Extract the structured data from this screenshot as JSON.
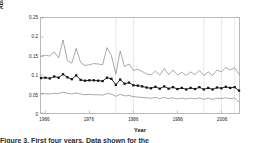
{
  "chart_data": {
    "type": "line",
    "title": "",
    "xlabel": "Year",
    "ylabel": "Abundance index",
    "xlim": [
      1965,
      2010
    ],
    "ylim": [
      0,
      0.25
    ],
    "xticks": [
      1966,
      1976,
      1986,
      1996,
      2006
    ],
    "yticks": [
      0,
      0.05,
      0.1,
      0.15,
      0.2,
      0.25
    ],
    "ytick_labels": [
      "0",
      "0.05",
      "0.1",
      "0.15",
      "0.2",
      "0.25"
    ],
    "xtick_labels": [
      "1966",
      "1976",
      "1986",
      "1996",
      "2006"
    ],
    "grid": "vertical-faint",
    "legend": "none",
    "gridlines_x": [
      1982,
      1986,
      2002,
      2006,
      2009
    ],
    "x": [
      1965,
      1966,
      1967,
      1968,
      1969,
      1970,
      1971,
      1972,
      1973,
      1974,
      1975,
      1976,
      1977,
      1978,
      1979,
      1980,
      1981,
      1982,
      1983,
      1984,
      1985,
      1986,
      1987,
      1988,
      1989,
      1990,
      1991,
      1992,
      1993,
      1994,
      1995,
      1996,
      1997,
      1998,
      1999,
      2000,
      2001,
      2002,
      2003,
      2004,
      2005,
      2006,
      2007,
      2008,
      2009,
      2010
    ],
    "series": [
      {
        "name": "Upper confidence limit",
        "style": "thin-line",
        "marker": "none",
        "color": "#6f6f6f",
        "values": [
          0.149,
          0.152,
          0.15,
          0.161,
          0.145,
          0.192,
          0.138,
          0.131,
          0.17,
          0.133,
          0.125,
          0.127,
          0.13,
          0.129,
          0.127,
          0.172,
          0.151,
          0.103,
          0.163,
          0.122,
          0.129,
          0.112,
          0.115,
          0.109,
          0.103,
          0.1,
          0.11,
          0.1,
          0.117,
          0.101,
          0.113,
          0.1,
          0.107,
          0.099,
          0.108,
          0.101,
          0.112,
          0.099,
          0.108,
          0.099,
          0.113,
          0.108,
          0.12,
          0.113,
          0.119,
          0.102
        ]
      },
      {
        "name": "Abundance index (central estimate)",
        "style": "line-with-markers",
        "marker": "filled-square",
        "color": "#111111",
        "values": [
          0.092,
          0.093,
          0.091,
          0.096,
          0.093,
          0.102,
          0.094,
          0.089,
          0.099,
          0.087,
          0.085,
          0.086,
          0.086,
          0.085,
          0.084,
          0.093,
          0.09,
          0.074,
          0.088,
          0.077,
          0.08,
          0.073,
          0.072,
          0.07,
          0.067,
          0.065,
          0.069,
          0.064,
          0.07,
          0.064,
          0.068,
          0.063,
          0.066,
          0.062,
          0.066,
          0.063,
          0.068,
          0.062,
          0.066,
          0.062,
          0.067,
          0.065,
          0.069,
          0.066,
          0.068,
          0.059
        ]
      },
      {
        "name": "Lower confidence limit",
        "style": "thin-line",
        "marker": "none",
        "color": "#6f6f6f",
        "values": [
          0.051,
          0.051,
          0.05,
          0.052,
          0.051,
          0.055,
          0.052,
          0.05,
          0.053,
          0.05,
          0.048,
          0.049,
          0.048,
          0.048,
          0.047,
          0.051,
          0.05,
          0.044,
          0.049,
          0.045,
          0.046,
          0.043,
          0.042,
          0.041,
          0.04,
          0.039,
          0.041,
          0.038,
          0.041,
          0.038,
          0.04,
          0.037,
          0.039,
          0.037,
          0.039,
          0.037,
          0.04,
          0.036,
          0.039,
          0.036,
          0.039,
          0.038,
          0.04,
          0.038,
          0.039,
          0.029
        ]
      }
    ]
  },
  "caption_sliver": "Figure 3.  First four years.  Data shown for the"
}
